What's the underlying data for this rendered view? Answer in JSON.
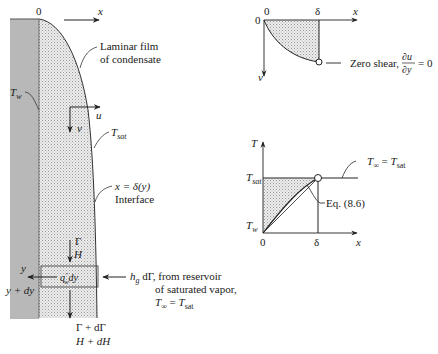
{
  "main_figure": {
    "origin_label": "0",
    "x_axis_label": "x",
    "film_label_line1": "Laminar film",
    "film_label_line2": "of condensate",
    "wall_temp": {
      "base": "T",
      "sub": "w"
    },
    "u_label": "u",
    "v_label": "v",
    "sat_temp": {
      "base": "T",
      "sub": "sat"
    },
    "interface_eq": "x = δ(y)",
    "interface_label": "Interface",
    "gamma_label": "Γ",
    "h_label": "H",
    "y_label": "y",
    "y_dy_label": "y + dy",
    "heat_flux": {
      "base": "q",
      "sup": "″",
      "sub": "w",
      "suffix": "dy"
    },
    "vapor_line1": {
      "base": "h",
      "sub": "g",
      "suffix": " dΓ, from reservoir"
    },
    "vapor_line2": "of saturated vapor,",
    "vapor_line3": {
      "lhs_base": "T",
      "lhs_sub": "∞",
      "eq": " = ",
      "rhs_base": "T",
      "rhs_sub": "sat"
    },
    "gamma_out_label": "Γ + dΓ",
    "h_out_label": "H + dH"
  },
  "velocity_profile": {
    "origin_x": "0",
    "origin_y": "0",
    "delta_label": "δ",
    "x_axis_label": "x",
    "v_axis_label": "v",
    "zero_shear_label": "Zero shear,",
    "derivative_num": "∂u",
    "derivative_den": "∂y",
    "derivative_eq": "= 0"
  },
  "temperature_profile": {
    "t_axis_label": "T",
    "t_sat": {
      "base": "T",
      "sub": "sat"
    },
    "t_w": {
      "base": "T",
      "sub": "w"
    },
    "origin_label": "0",
    "delta_label": "δ",
    "x_axis_label": "x",
    "t_inf_eq": {
      "lhs_base": "T",
      "lhs_sub": "∞",
      "eq": " = ",
      "rhs_base": "T",
      "rhs_sub": "sat"
    },
    "eq_ref": "Eq. (8.6)"
  },
  "colors": {
    "wall": "#b8b8b8",
    "film": "#e6e6e6",
    "line": "#222222"
  }
}
